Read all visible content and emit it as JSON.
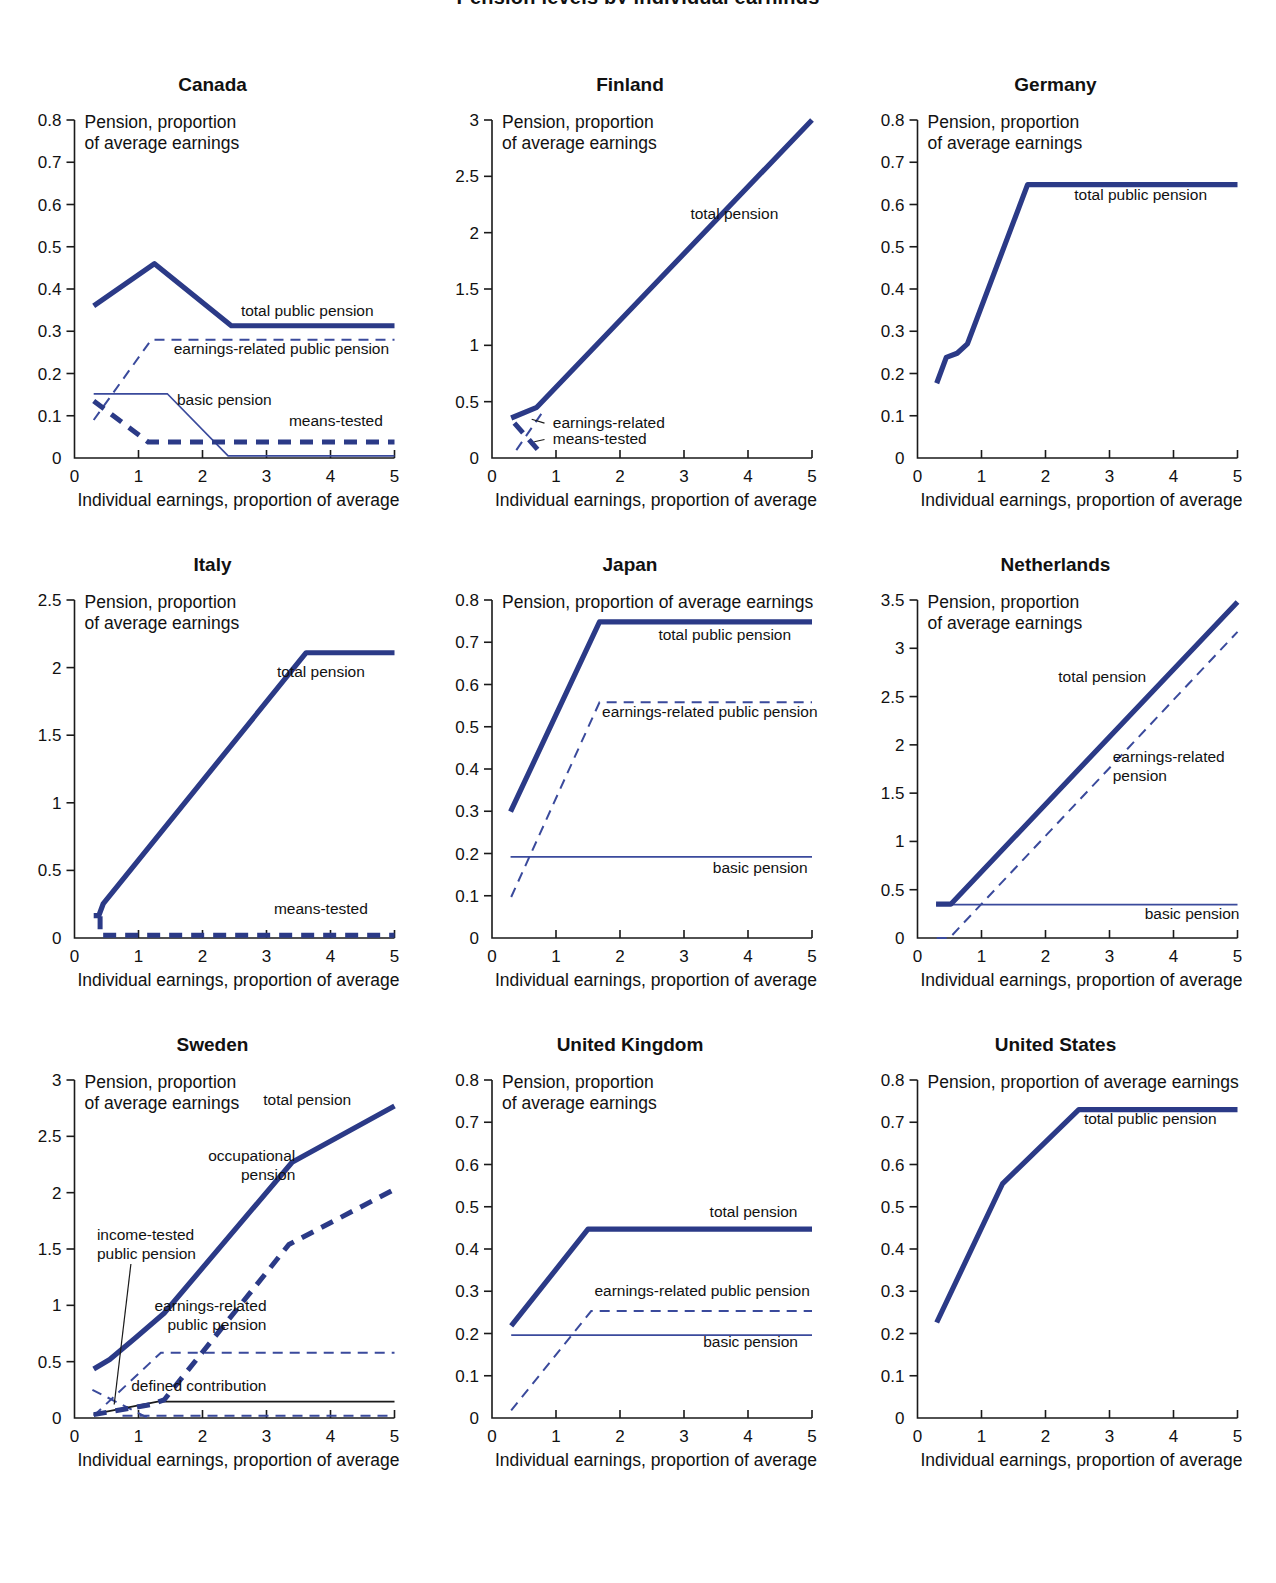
{
  "figure": {
    "title": "Pension levels by individual earnings",
    "axis_x_caption": "Individual earnings, proportion of average",
    "axis_y_caption_line1": "Pension, proportion",
    "axis_y_caption_line2": "of average earnings",
    "axis_y_caption_single": "Pension, proportion of average earnings",
    "accent_color": "#2b3a87",
    "thin_color": "#3a4a9c",
    "text_color": "#111111"
  },
  "chart_data": [
    {
      "type": "line",
      "title": "Canada",
      "xlabel": "Individual earnings, proportion of average",
      "ylabel": "Pension, proportion of average earnings",
      "xlim": [
        0,
        5
      ],
      "ylim": [
        0,
        0.8
      ],
      "xticks": [
        "0",
        "1",
        "2",
        "3",
        "4",
        "5"
      ],
      "yticks": [
        "0",
        "0.1",
        "0.2",
        "0.3",
        "0.4",
        "0.5",
        "0.6",
        "0.7",
        "0.8"
      ],
      "grid": false,
      "legend": "inline-annotations",
      "series": [
        {
          "name": "total public pension",
          "style": "thick-solid",
          "label_x": 2.6,
          "label_y": 0.335,
          "x": [
            0.3,
            1.25,
            2.45,
            5
          ],
          "values": [
            0.36,
            0.46,
            0.313,
            0.313
          ]
        },
        {
          "name": "earnings-related public pension",
          "style": "thin-dashed",
          "label_x": 1.55,
          "label_y": 0.245,
          "x": [
            0.3,
            1.2,
            5
          ],
          "values": [
            0.09,
            0.28,
            0.28
          ]
        },
        {
          "name": "basic pension",
          "style": "thin-solid",
          "label_x": 1.6,
          "label_y": 0.125,
          "x": [
            0.3,
            1.45,
            2.4,
            5
          ],
          "values": [
            0.152,
            0.152,
            0.005,
            0.005
          ]
        },
        {
          "name": "means-tested",
          "style": "thick-dashed",
          "label_x": 3.35,
          "label_y": 0.075,
          "x": [
            0.3,
            1.15,
            5
          ],
          "values": [
            0.135,
            0.038,
            0.038
          ]
        }
      ]
    },
    {
      "type": "line",
      "title": "Finland",
      "xlabel": "Individual earnings, proportion of average",
      "ylabel": "Pension, proportion of average earnings",
      "xlim": [
        0,
        5
      ],
      "ylim": [
        0,
        3
      ],
      "xticks": [
        "0",
        "1",
        "2",
        "3",
        "4",
        "5"
      ],
      "yticks": [
        "0",
        "0.5",
        "1",
        "1.5",
        "2",
        "2.5",
        "3"
      ],
      "grid": false,
      "legend": "inline-annotations",
      "series": [
        {
          "name": "total pension",
          "style": "thick-solid",
          "label_x": 3.1,
          "label_y": 2.12,
          "x": [
            0.3,
            0.7,
            5
          ],
          "values": [
            0.355,
            0.45,
            3.0
          ]
        },
        {
          "name": "earnings-related",
          "style": "thin-dashed",
          "label_x": 0.95,
          "label_y": 0.265,
          "x": [
            0.38,
            0.78
          ],
          "values": [
            0.07,
            0.4
          ]
        },
        {
          "name": "means-tested",
          "style": "thick-dashed",
          "label_x": 0.95,
          "label_y": 0.12,
          "x": [
            0.35,
            0.8
          ],
          "values": [
            0.31,
            0.02
          ]
        }
      ]
    },
    {
      "type": "line",
      "title": "Germany",
      "xlabel": "Individual earnings, proportion of average",
      "ylabel": "Pension, proportion of average earnings",
      "xlim": [
        0,
        5
      ],
      "ylim": [
        0,
        0.8
      ],
      "xticks": [
        "0",
        "1",
        "2",
        "3",
        "4",
        "5"
      ],
      "yticks": [
        "0",
        "0.1",
        "0.2",
        "0.3",
        "0.4",
        "0.5",
        "0.6",
        "0.7",
        "0.8"
      ],
      "grid": false,
      "legend": "inline-annotations",
      "series": [
        {
          "name": "total public pension",
          "style": "thick-solid",
          "label_x": 2.45,
          "label_y": 0.61,
          "x": [
            0.3,
            0.45,
            0.62,
            0.78,
            1.72,
            5
          ],
          "values": [
            0.177,
            0.238,
            0.248,
            0.27,
            0.647,
            0.647
          ]
        }
      ]
    },
    {
      "type": "line",
      "title": "Italy",
      "xlabel": "Individual earnings, proportion of average",
      "ylabel": "Pension, proportion of average earnings",
      "xlim": [
        0,
        5
      ],
      "ylim": [
        0,
        2.5
      ],
      "xticks": [
        "0",
        "1",
        "2",
        "3",
        "4",
        "5"
      ],
      "yticks": [
        "0",
        "0.5",
        "1",
        "1.5",
        "2",
        "2.5"
      ],
      "grid": false,
      "legend": "inline-annotations",
      "series": [
        {
          "name": "total pension",
          "style": "thick-solid",
          "label_x": 3.85,
          "label_y": 1.93,
          "x": [
            0.3,
            0.38,
            0.45,
            3.62,
            5
          ],
          "values": [
            0.165,
            0.165,
            0.255,
            2.11,
            2.11
          ]
        },
        {
          "name": "means-tested",
          "style": "thick-dashed",
          "label_x": 3.85,
          "label_y": 0.175,
          "x": [
            0.4,
            0.4,
            5
          ],
          "values": [
            0.16,
            0.02,
            0.02
          ]
        }
      ]
    },
    {
      "type": "line",
      "title": "Japan",
      "xlabel": "Individual earnings, proportion of average",
      "ylabel": "Pension, proportion of average earnings",
      "xlim": [
        0,
        5
      ],
      "ylim": [
        0,
        0.8
      ],
      "xticks": [
        "0",
        "1",
        "2",
        "3",
        "4",
        "5"
      ],
      "yticks": [
        "0",
        "0.1",
        "0.2",
        "0.3",
        "0.4",
        "0.5",
        "0.6",
        "0.7",
        "0.8"
      ],
      "grid": false,
      "legend": "inline-annotations",
      "series": [
        {
          "name": "total public pension",
          "style": "thick-solid",
          "label_x": 2.6,
          "label_y": 0.705,
          "x": [
            0.29,
            1.68,
            5
          ],
          "values": [
            0.299,
            0.748,
            0.748
          ]
        },
        {
          "name": "earnings-related public pension",
          "style": "thin-dashed",
          "label_x": 1.72,
          "label_y": 0.523,
          "x": [
            0.3,
            1.68,
            5
          ],
          "values": [
            0.097,
            0.558,
            0.558
          ]
        },
        {
          "name": "basic pension",
          "style": "thin-solid",
          "label_x": 3.45,
          "label_y": 0.155,
          "x": [
            0.29,
            5
          ],
          "values": [
            0.192,
            0.192
          ]
        }
      ]
    },
    {
      "type": "line",
      "title": "Netherlands",
      "xlabel": "Individual earnings, proportion of average",
      "ylabel": "Pension, proportion of average earnings",
      "xlim": [
        0,
        5
      ],
      "ylim": [
        0,
        3.5
      ],
      "xticks": [
        "0",
        "1",
        "2",
        "3",
        "4",
        "5"
      ],
      "yticks": [
        "0",
        "0.5",
        "1",
        "1.5",
        "2",
        "2.5",
        "3",
        "3.5"
      ],
      "grid": false,
      "legend": "inline-annotations",
      "series": [
        {
          "name": "total pension",
          "style": "thick-solid",
          "label_x": 2.2,
          "label_y": 2.65,
          "x": [
            0.29,
            0.52,
            5
          ],
          "values": [
            0.35,
            0.35,
            3.48
          ]
        },
        {
          "name": "earnings-related pension",
          "style": "thin-dashed",
          "label_x": 3.05,
          "label_y": 1.82,
          "x": [
            0.3,
            0.5,
            5
          ],
          "values": [
            0.0,
            0.0,
            3.17
          ]
        },
        {
          "name": "basic  pension",
          "style": "thin-solid",
          "label_x": 3.55,
          "label_y": 0.2,
          "x": [
            0.29,
            5
          ],
          "values": [
            0.345,
            0.345
          ]
        }
      ]
    },
    {
      "type": "line",
      "title": "Sweden",
      "xlabel": "Individual earnings, proportion of average",
      "ylabel": "Pension, proportion of average earnings",
      "xlim": [
        0,
        5
      ],
      "ylim": [
        0,
        3
      ],
      "xticks": [
        "0",
        "1",
        "2",
        "3",
        "4",
        "5"
      ],
      "yticks": [
        "0",
        "0.5",
        "1",
        "1.5",
        "2",
        "2.5",
        "3"
      ],
      "grid": false,
      "legend": "inline-annotations",
      "series": [
        {
          "name": "total pension",
          "style": "thick-solid",
          "label_x": 2.95,
          "label_y": 2.78,
          "x": [
            0.3,
            0.55,
            0.95,
            1.4,
            3.4,
            5
          ],
          "values": [
            0.435,
            0.52,
            0.71,
            0.93,
            2.27,
            2.77
          ]
        },
        {
          "name": "occupational pension",
          "style": "thick-dashed",
          "label_x": 3.45,
          "label_y": 2.28,
          "x": [
            0.3,
            1.2,
            1.4,
            3.35,
            5
          ],
          "values": [
            0.03,
            0.12,
            0.16,
            1.54,
            2.03
          ]
        },
        {
          "name": "earnings-related public pension",
          "style": "thin-dashed",
          "label_x": 3.0,
          "label_y": 0.95,
          "x": [
            0.3,
            1.35,
            5
          ],
          "values": [
            0.02,
            0.58,
            0.58
          ]
        },
        {
          "name": "income-tested public pension",
          "style": "thin-dashed",
          "label_x": 0.35,
          "label_y": 1.58,
          "leader": true,
          "x": [
            0.28,
            1.15
          ],
          "values": [
            0.25,
            0.0
          ]
        },
        {
          "name": "defined contribution",
          "style": "black-thin",
          "label_x": 3.0,
          "label_y": 0.24,
          "x": [
            0.3,
            1.3,
            5
          ],
          "values": [
            0.035,
            0.145,
            0.145
          ]
        },
        {
          "name": "base-dashed",
          "style": "thin-dashed",
          "label_x": null,
          "label_y": null,
          "x": [
            0.75,
            5
          ],
          "values": [
            0.02,
            0.02
          ]
        }
      ]
    },
    {
      "type": "line",
      "title": "United Kingdom",
      "xlabel": "Individual earnings, proportion of average",
      "ylabel": "Pension, proportion of average earnings",
      "xlim": [
        0,
        5
      ],
      "ylim": [
        0,
        0.8
      ],
      "xticks": [
        "0",
        "1",
        "2",
        "3",
        "4",
        "5"
      ],
      "yticks": [
        "0",
        "0.1",
        "0.2",
        "0.3",
        "0.4",
        "0.5",
        "0.6",
        "0.7",
        "0.8"
      ],
      "grid": false,
      "legend": "inline-annotations",
      "series": [
        {
          "name": "total pension",
          "style": "thick-solid",
          "label_x": 3.4,
          "label_y": 0.475,
          "x": [
            0.3,
            1.5,
            5
          ],
          "values": [
            0.218,
            0.447,
            0.447
          ]
        },
        {
          "name": "earnings-related public pension",
          "style": "thin-dashed",
          "label_x": 1.6,
          "label_y": 0.288,
          "x": [
            0.3,
            1.55,
            5
          ],
          "values": [
            0.018,
            0.253,
            0.253
          ]
        },
        {
          "name": "basic pension",
          "style": "thin-solid",
          "label_x": 3.3,
          "label_y": 0.168,
          "x": [
            0.3,
            5
          ],
          "values": [
            0.196,
            0.196
          ]
        }
      ]
    },
    {
      "type": "line",
      "title": "United States",
      "xlabel": "Individual earnings, proportion of average",
      "ylabel": "Pension, proportion of average earnings",
      "xlim": [
        0,
        5
      ],
      "ylim": [
        0,
        0.8
      ],
      "xticks": [
        "0",
        "1",
        "2",
        "3",
        "4",
        "5"
      ],
      "yticks": [
        "0",
        "0.1",
        "0.2",
        "0.3",
        "0.4",
        "0.5",
        "0.6",
        "0.7",
        "0.8"
      ],
      "grid": false,
      "legend": "inline-annotations",
      "series": [
        {
          "name": "total public pension",
          "style": "thick-solid",
          "label_x": 2.6,
          "label_y": 0.695,
          "x": [
            0.3,
            1.33,
            2.52,
            5
          ],
          "values": [
            0.226,
            0.555,
            0.73,
            0.73
          ]
        }
      ]
    }
  ]
}
